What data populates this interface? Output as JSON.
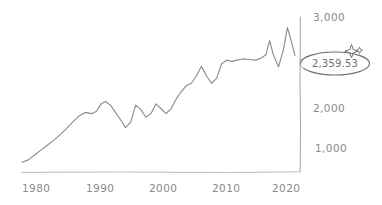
{
  "chart_data": {
    "type": "line",
    "title": "",
    "subtitle": "",
    "xlabel": "",
    "ylabel": "",
    "xlim": [
      1979,
      2023
    ],
    "ylim": [
      600,
      3150
    ],
    "grid": false,
    "legend": null,
    "style": "hand-drawn sketch",
    "series": [
      {
        "name": "index-level",
        "color": "#8d8d8d",
        "x": [
          1979.0,
          1980.0,
          1981.0,
          1982.0,
          1983.0,
          1984.0,
          1985.0,
          1986.0,
          1987.0,
          1988.0,
          1989.0,
          1990.0,
          1990.8,
          1991.5,
          1992.2,
          1993.0,
          1993.8,
          1994.6,
          1995.4,
          1996.2,
          1997.0,
          1997.8,
          1998.6,
          1999.4,
          2000.2,
          2001.0,
          2001.8,
          2002.6,
          2003.4,
          2004.2,
          2005.0,
          2005.8,
          2006.6,
          2007.4,
          2008.2,
          2009.0,
          2009.8,
          2010.6,
          2011.4,
          2012.2,
          2013.0,
          2014.0,
          2015.0,
          2016.0,
          2016.8,
          2017.6,
          2018.2,
          2018.8,
          2019.6,
          2020.4,
          2021.0,
          2021.6,
          2022.2
        ],
        "y": [
          760,
          800,
          880,
          960,
          1040,
          1120,
          1210,
          1310,
          1420,
          1520,
          1580,
          1560,
          1600,
          1720,
          1760,
          1700,
          1580,
          1460,
          1330,
          1420,
          1700,
          1630,
          1500,
          1560,
          1720,
          1640,
          1560,
          1640,
          1800,
          1920,
          2020,
          2060,
          2180,
          2340,
          2180,
          2060,
          2140,
          2380,
          2440,
          2420,
          2440,
          2460,
          2450,
          2440,
          2470,
          2530,
          2760,
          2520,
          2330,
          2620,
          2980,
          2760,
          2520
        ]
      }
    ],
    "y_ticks": [
      {
        "value": 1000,
        "label": "1,000"
      },
      {
        "value": 2000,
        "label": "2,000"
      },
      {
        "value": 3000,
        "label": "3,000"
      }
    ],
    "x_ticks": [
      {
        "value": 1980,
        "label": "1980"
      },
      {
        "value": 1990,
        "label": "1990"
      },
      {
        "value": 2000,
        "label": "2000"
      },
      {
        "value": 2010,
        "label": "2010"
      },
      {
        "value": 2020,
        "label": "2020"
      }
    ],
    "annotations": [
      {
        "type": "circled-callout",
        "text": "2,359.53",
        "icon": "sparkle-icon",
        "shape": "ellipse",
        "color": "#6f6f6f"
      }
    ]
  },
  "axes": {
    "y_axis_color": "#a9a9a9",
    "x_axis_color": "#bdbdbd"
  },
  "colors": {
    "background": "#ffffff",
    "line": "#8d8d8d",
    "tick_label": "#8a8a8a",
    "annotation": "#6f6f6f"
  }
}
